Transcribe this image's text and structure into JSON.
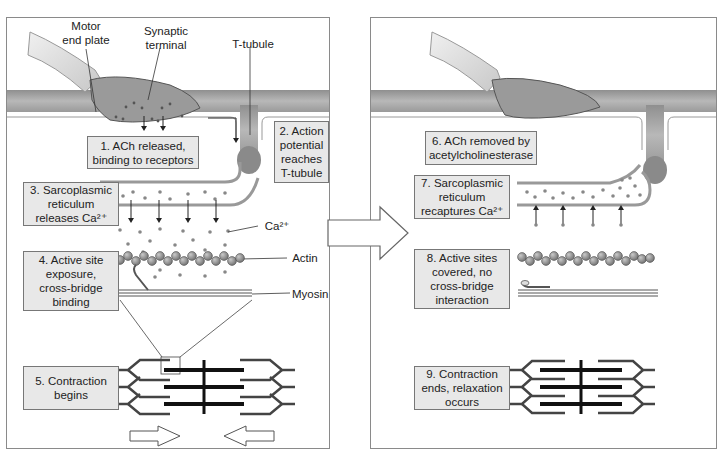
{
  "diagram": {
    "left_panel": {
      "callouts": {
        "motor_end_plate": "Motor\nend plate",
        "synaptic_terminal": "Synaptic\nterminal",
        "t_tubule": "T-tubule",
        "ca": "Ca²⁺",
        "actin": "Actin",
        "myosin": "Myosin"
      },
      "steps": [
        {
          "num": 1,
          "text": "1. ACh released,\nbinding to receptors"
        },
        {
          "num": 2,
          "text": "2. Action\npotential\nreaches\nT-tubule"
        },
        {
          "num": 3,
          "text": "3. Sarcoplasmic\nreticulum\nreleases Ca²⁺"
        },
        {
          "num": 4,
          "text": "4. Active site\nexposure,\ncross-bridge\nbinding"
        },
        {
          "num": 5,
          "text": "5. Contraction\nbegins"
        }
      ]
    },
    "right_panel": {
      "steps": [
        {
          "num": 6,
          "text": "6. ACh removed by\nacetylcholinesterase"
        },
        {
          "num": 7,
          "text": "7. Sarcoplasmic\nreticulum\nrecaptures Ca²⁺"
        },
        {
          "num": 8,
          "text": "8. Active sites\ncovered, no\ncross-bridge\ninteraction"
        },
        {
          "num": 9,
          "text": "9. Contraction\nends, relaxation\noccurs"
        }
      ]
    },
    "colors": {
      "label_fill": "#e8e8e8",
      "membrane": "#a9a9a9",
      "terminal": "#9a9a9a",
      "actin_bead": "#8e8e8e",
      "thick_filament": "#222222",
      "thin_filament": "#555555"
    }
  }
}
